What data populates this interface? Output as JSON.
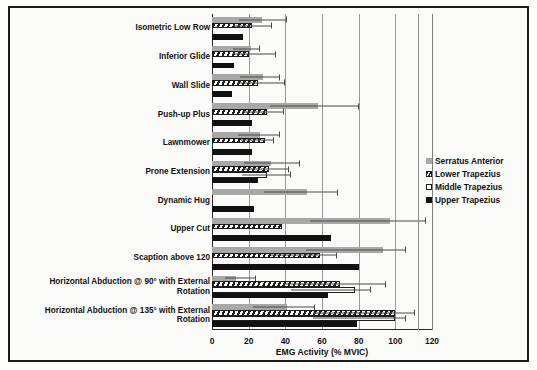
{
  "chart_data": {
    "type": "bar",
    "orientation": "horizontal",
    "title": "",
    "xlabel": "EMG Activity (% MVIC)",
    "ylabel": "",
    "xlim": [
      0,
      120
    ],
    "xticks": [
      0,
      20,
      40,
      60,
      80,
      100,
      120
    ],
    "grid": true,
    "legend_position": "right",
    "categories": [
      "Isometric Low Row",
      "Inferior Glide",
      "Wall Slide",
      "Push-up Plus",
      "Lawnmower",
      "Prone Extension",
      "Dynamic Hug",
      "Upper Cut",
      "Scaption above 120",
      "Horizontal Abduction @ 90° with External Rotation",
      "Horizontal Abduction @ 135° with External Rotation"
    ],
    "series": [
      {
        "name": "Serratus Anterior",
        "color": "#a8a8a8",
        "pattern": "solid-gray",
        "values": [
          27,
          21,
          28,
          58,
          26,
          32,
          52,
          97,
          93,
          13,
          41
        ],
        "errors": [
          14,
          5,
          9,
          22,
          11,
          16,
          17,
          20,
          13,
          11,
          15
        ]
      },
      {
        "name": "Lower Trapezius",
        "color": "#1c1c1c",
        "pattern": "diagonal-hatch",
        "values": [
          22,
          20,
          25,
          30,
          29,
          31,
          0,
          38,
          59,
          70,
          100
        ],
        "errors": [
          11,
          15,
          15,
          9,
          5,
          11,
          0,
          0,
          9,
          25,
          11
        ]
      },
      {
        "name": "Middle Trapezius",
        "color": "#ffffff",
        "pattern": "open-white",
        "values": [
          0,
          0,
          0,
          0,
          0,
          30,
          0,
          0,
          0,
          78,
          100
        ],
        "errors": [
          0,
          0,
          0,
          0,
          0,
          13,
          0,
          0,
          0,
          9,
          6
        ]
      },
      {
        "name": "Upper Trapezius",
        "color": "#111111",
        "pattern": "solid-black",
        "values": [
          17,
          12,
          11,
          22,
          22,
          25,
          23,
          65,
          80,
          63,
          79
        ]
      }
    ]
  },
  "legend": {
    "items": [
      {
        "label": "Serratus Anterior",
        "swatch": "serratus"
      },
      {
        "label": "Lower Trapezius",
        "swatch": "lowertrap"
      },
      {
        "label": "Middle Trapezius",
        "swatch": "middletrap"
      },
      {
        "label": "Upper Trapezius",
        "swatch": "uppertrap"
      }
    ]
  }
}
